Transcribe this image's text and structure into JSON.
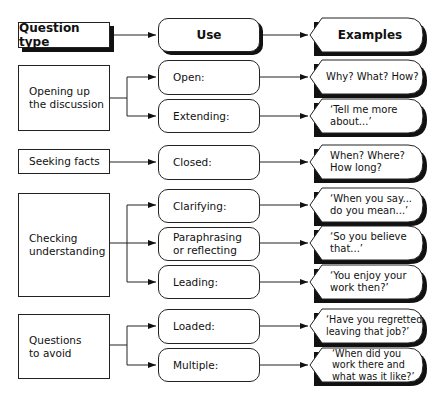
{
  "diagram": {
    "headers": {
      "question_type": "Question type",
      "use": "Use",
      "examples": "Examples"
    },
    "groups": [
      {
        "type": "Opening up\nthe discussion",
        "uses": [
          {
            "label": "Open:",
            "example": "Why? What? How?"
          },
          {
            "label": "Extending:",
            "example": "‘Tell me more\nabout...’"
          }
        ]
      },
      {
        "type": "Seeking facts",
        "uses": [
          {
            "label": "Closed:",
            "example": "When? Where?\nHow long?"
          }
        ]
      },
      {
        "type": "Checking\nunderstanding",
        "uses": [
          {
            "label": "Clarifying:",
            "example": "‘When you say...\ndo you mean...’"
          },
          {
            "label": "Paraphrasing\nor reflecting",
            "example": "‘So you believe\nthat...’"
          },
          {
            "label": "Leading:",
            "example": "‘You enjoy your\nwork then?’"
          }
        ]
      },
      {
        "type": "Questions\nto avoid",
        "uses": [
          {
            "label": "Loaded:",
            "example": "‘Have you regretted\nleaving that job?’"
          },
          {
            "label": "Multiple:",
            "example": "‘When did you\nwork there and\nwhat was it like?’"
          }
        ]
      }
    ],
    "colors": {
      "stroke": "#222222",
      "shadow": "#111111",
      "fill": "#ffffff"
    }
  }
}
